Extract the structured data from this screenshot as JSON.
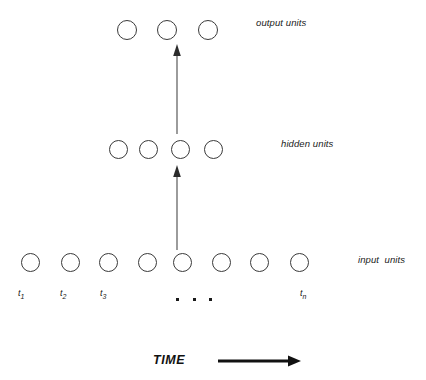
{
  "diagram": {
    "background_color": "#ffffff",
    "stroke_color": "#3a3a3a",
    "text_color": "#1a1a1a",
    "layers": [
      {
        "id": "output",
        "label": "output units",
        "unit_count": 3,
        "label_x": 256,
        "label_y": 17,
        "circle_y": 20,
        "circle_d": 20,
        "circle_x": [
          117,
          157,
          198
        ]
      },
      {
        "id": "hidden",
        "label": "hidden units",
        "unit_count": 4,
        "label_x": 281,
        "label_y": 138,
        "circle_y": 140,
        "circle_d": 19,
        "circle_x": [
          109,
          139,
          171,
          204
        ]
      },
      {
        "id": "input",
        "label": "input  units",
        "unit_count": 8,
        "label_x": 358,
        "label_y": 254,
        "circle_y": 253,
        "circle_d": 19,
        "circle_x": [
          21,
          61,
          99,
          138,
          173,
          212,
          250,
          290
        ]
      }
    ],
    "connections": [
      {
        "id": "hidden-to-output",
        "from_layer": "hidden",
        "to_layer": "output",
        "x": 177,
        "y_start": 134,
        "y_end": 46
      },
      {
        "id": "input-to-hidden",
        "from_layer": "input",
        "to_layer": "hidden",
        "x": 177,
        "y_start": 250,
        "y_end": 166
      }
    ],
    "time_step_labels": [
      {
        "base": "t",
        "sub": "1",
        "x": 18,
        "y": 288
      },
      {
        "base": "t",
        "sub": "2",
        "x": 60,
        "y": 288
      },
      {
        "base": "t",
        "sub": "3",
        "x": 100,
        "y": 288
      },
      {
        "base": "t",
        "sub": "n",
        "x": 300,
        "y": 288
      }
    ],
    "ellipsis_dots": [
      {
        "x": 176,
        "y": 298
      },
      {
        "x": 193,
        "y": 298
      },
      {
        "x": 209,
        "y": 298
      }
    ],
    "time_axis": {
      "label": "TIME",
      "label_x": 153,
      "label_y": 353,
      "arrow": {
        "x_start": 218,
        "x_end": 300,
        "y": 361,
        "thickness": 3
      }
    }
  }
}
